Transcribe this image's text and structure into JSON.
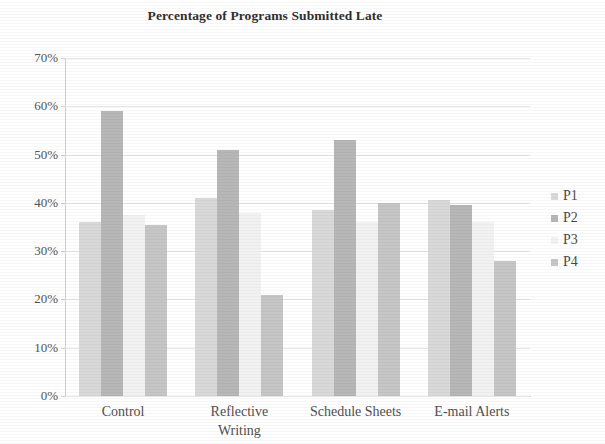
{
  "chart_data": {
    "type": "bar",
    "title": "Percentage of Programs Submitted Late",
    "xlabel": "",
    "ylabel": "",
    "ylim": [
      0,
      70
    ],
    "ytick_labels": [
      "70%",
      "60%",
      "50%",
      "40%",
      "30%",
      "20%",
      "10%",
      "0%"
    ],
    "ytick_values": [
      70,
      60,
      50,
      40,
      30,
      20,
      10,
      0
    ],
    "grid": true,
    "legend_position": "right",
    "categories": [
      "Control",
      "Reflective Writing",
      "Schedule Sheets",
      "E-mail Alerts"
    ],
    "category_lines": [
      [
        "Control"
      ],
      [
        "Reflective",
        "Writing"
      ],
      [
        "Schedule Sheets"
      ],
      [
        "E-mail Alerts"
      ]
    ],
    "series": [
      {
        "name": "P1",
        "color": "#d9d9d9",
        "values": [
          36,
          41,
          38.5,
          40.5
        ]
      },
      {
        "name": "P2",
        "color": "#b7b7b7",
        "values": [
          59,
          51,
          53,
          39.5
        ]
      },
      {
        "name": "P3",
        "color": "#f2f2f2",
        "values": [
          37.5,
          38,
          36,
          36
        ]
      },
      {
        "name": "P4",
        "color": "#c6c6c6",
        "values": [
          35.5,
          21,
          40,
          28
        ]
      }
    ]
  },
  "legend": {
    "items": [
      {
        "label": "P1"
      },
      {
        "label": "P2"
      },
      {
        "label": "P3"
      },
      {
        "label": "P4"
      }
    ]
  }
}
